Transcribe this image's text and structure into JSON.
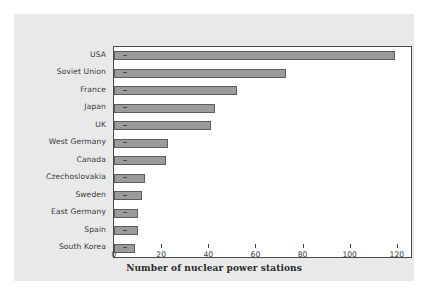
{
  "chart_data": {
    "type": "bar",
    "orientation": "horizontal",
    "title": "",
    "xlabel": "Number of nuclear power stations",
    "ylabel": "",
    "categories": [
      "USA",
      "Soviet Union",
      "France",
      "Japan",
      "UK",
      "West Germany",
      "Canada",
      "Czechoslovakia",
      "Sweden",
      "East Germany",
      "Spain",
      "South Korea"
    ],
    "values": [
      119,
      73,
      52,
      43,
      41,
      23,
      22,
      13,
      12,
      10,
      10,
      9
    ],
    "xlim": [
      0,
      126
    ],
    "xticks": [
      0,
      20,
      40,
      60,
      80,
      100,
      120
    ],
    "xticklabels": [
      "0",
      "20",
      "40",
      "60",
      "80",
      "100",
      "120"
    ],
    "grid": false,
    "legend": null,
    "bar_color": "#9b9b9b",
    "bar_edge_color": "#5d5d5d",
    "panel_color": "#e9e9e9",
    "plot_background": "#ffffff",
    "axis_color": "#4a4a4a",
    "text_color": "#3a3a3a"
  }
}
